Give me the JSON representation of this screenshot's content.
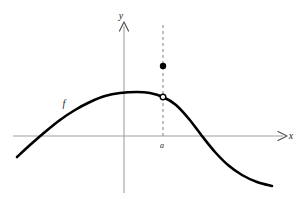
{
  "figure": {
    "kind": "cartesian-function-graph",
    "background_color": "#ffffff",
    "width": 301,
    "height": 212
  },
  "axes": {
    "x_axis": {
      "label": "x",
      "color": "#a0a0a0",
      "arrow": "right"
    },
    "y_axis": {
      "label": "y",
      "color": "#a0a0a0",
      "arrow": "up"
    },
    "origin_label": ""
  },
  "curve": {
    "label": "f",
    "color": "#000000",
    "stroke_width": 2.6
  },
  "markers": {
    "filled_point": {
      "label": "",
      "color": "#000000",
      "radius": 3.2
    },
    "open_point": {
      "label": "",
      "stroke_color": "#000000",
      "fill_color": "#ffffff",
      "radius": 2.8
    }
  },
  "guides": {
    "vertical_dashed": {
      "color": "#8c8c8c",
      "dash": "3 3"
    },
    "x_tick_label": "a"
  },
  "chart_data": {
    "type": "line",
    "title": "",
    "xlabel": "x",
    "ylabel": "y",
    "grid": false,
    "legend": null,
    "series": [
      {
        "name": "f",
        "comment": "smooth hump: rises from lower-left, peaks left of a, falls to lower-right",
        "points_px": [
          [
            17,
            157
          ],
          [
            30,
            145
          ],
          [
            45,
            132
          ],
          [
            60,
            120
          ],
          [
            75,
            110
          ],
          [
            90,
            102
          ],
          [
            105,
            96
          ],
          [
            120,
            93
          ],
          [
            137,
            92
          ],
          [
            150,
            93
          ],
          [
            163,
            97
          ],
          [
            176,
            105
          ],
          [
            189,
            119
          ],
          [
            202,
            136
          ],
          [
            215,
            152
          ],
          [
            228,
            165
          ],
          [
            242,
            175
          ],
          [
            257,
            182
          ],
          [
            272,
            186
          ]
        ]
      }
    ],
    "annotations": [
      {
        "name": "curve-name",
        "text": "f",
        "x_px": 64,
        "y_px": 103
      },
      {
        "name": "x-axis-name",
        "text": "x",
        "x_px": 291,
        "y_px": 136
      },
      {
        "name": "y-axis-name",
        "text": "y",
        "x_px": 124,
        "y_px": 18
      },
      {
        "name": "a-tick",
        "text": "a",
        "x_px": 162,
        "y_px": 146
      }
    ],
    "markers": [
      {
        "name": "limit-value-point",
        "style": "filled",
        "x_px": 163,
        "y_px": 66
      },
      {
        "name": "function-value-hole",
        "style": "open",
        "x_px": 163,
        "y_px": 97
      }
    ],
    "axis_px": {
      "x_axis_y": 136,
      "x_axis_from": 13,
      "x_axis_to": 287,
      "y_axis_x": 124,
      "y_axis_from": 22,
      "y_axis_to": 193
    },
    "dashed_guide_px": {
      "x": 163,
      "y_top": 25,
      "y_bottom": 138
    }
  }
}
